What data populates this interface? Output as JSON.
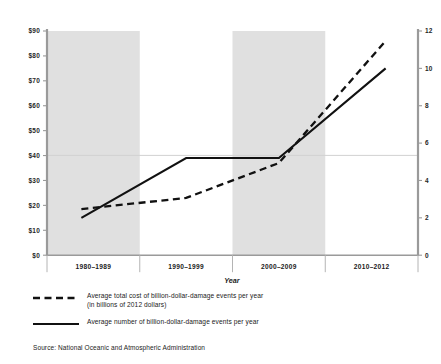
{
  "chart_data": {
    "type": "line",
    "title": "",
    "xlabel": "Year",
    "categories": [
      "1980–1989",
      "1990–1999",
      "2000–2009",
      "2010–2012"
    ],
    "grid": "horizontal gridline at $40 / 5.3 events",
    "legend_position": "below-plot-left",
    "axes": {
      "left": {
        "label": "Average total cost of billion-dollar-damage events per year (in billions of 2012 dollars)",
        "ticks": [
          "$0",
          "$10",
          "$20",
          "$30",
          "$40",
          "$50",
          "$60",
          "$70",
          "$80",
          "$90"
        ],
        "tick_values": [
          0,
          10,
          20,
          30,
          40,
          50,
          60,
          70,
          80,
          90
        ],
        "ylim": [
          0,
          90
        ]
      },
      "right": {
        "label": "Average number of billion-dollar-damage events per year",
        "ticks": [
          "0",
          "2",
          "4",
          "6",
          "8",
          "10",
          "12"
        ],
        "tick_values": [
          0,
          2,
          4,
          6,
          8,
          10,
          12
        ],
        "ylim": [
          0,
          12
        ]
      }
    },
    "shaded_bands": [
      "1980–1989",
      "2000–2009"
    ],
    "series": [
      {
        "name": "Average total cost of billion-dollar-damage events per year (in billions of 2012 dollars)",
        "axis": "left",
        "style": "dashed",
        "units": "billions of 2012 dollars",
        "values": [
          18.5,
          23.0,
          37.0,
          86.0
        ]
      },
      {
        "name": "Average number of billion-dollar-damage events per year",
        "axis": "right",
        "style": "solid",
        "units": "events per year",
        "values": [
          2.0,
          5.2,
          5.2,
          10.0
        ]
      }
    ]
  },
  "legend": {
    "items": [
      {
        "style": "dashed",
        "line1": "Average total cost of billion-dollar-damage events per year",
        "line2": "(in billions of 2012 dollars)"
      },
      {
        "style": "solid",
        "line1": "Average number of billion-dollar-damage events per year",
        "line2": ""
      }
    ]
  },
  "source": {
    "text": "Source: National Oceanic and Atmospheric Administration"
  },
  "colors": {
    "line": "#111111",
    "band": "#e0e0e0",
    "axis": "#9a9a9a",
    "grid": "#dcdcdc",
    "text": "#1a1a1a"
  }
}
